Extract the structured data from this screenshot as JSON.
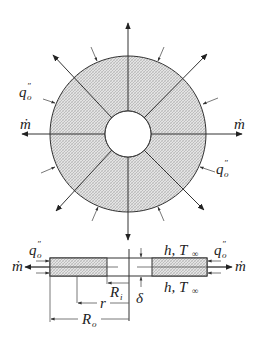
{
  "figure": {
    "top_view": {
      "labels": {
        "mass_flow": "ṁ",
        "heat_flux_q": "q",
        "heat_flux_sub": "o",
        "heat_flux_prime": "″"
      },
      "center": [
        128,
        134
      ],
      "outer_radius": 78,
      "inner_radius": 23,
      "fill_color": "#cfcfcf"
    },
    "cross_section": {
      "labels": {
        "mass_flow": "ṁ",
        "heat_flux_q": "q",
        "heat_flux_sub": "o",
        "heat_flux_prime": "″",
        "h_T_top": "h, T",
        "h_T_bottom": "h, T",
        "infinity_sub": "∞",
        "inner_radius_R": "R",
        "inner_radius_sub": "i",
        "radius_r": "r",
        "outer_radius_R": "R",
        "outer_radius_sub": "o",
        "thickness": "δ"
      }
    }
  }
}
